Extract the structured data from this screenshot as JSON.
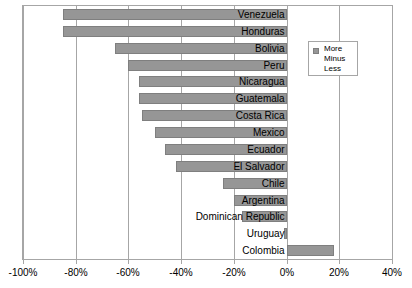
{
  "chart_data": {
    "type": "bar",
    "orientation": "horizontal",
    "title": "",
    "subtitle": "",
    "xlabel": "",
    "ylabel": "",
    "xlim": [
      -100,
      40
    ],
    "xticks": [
      -100,
      -80,
      -60,
      -40,
      -20,
      0,
      20,
      40
    ],
    "xtick_labels": [
      "-100%",
      "-80%",
      "-60%",
      "-40%",
      "-20%",
      "0%",
      "20%",
      "40%"
    ],
    "grid": true,
    "grid_axis": "x",
    "legend_position": "top-right",
    "series": [
      {
        "name": "More Minus Less",
        "color": "#969696",
        "values": [
          -85,
          -85,
          -65,
          -60,
          -56,
          -56,
          -55,
          -50,
          -46,
          -42,
          -24,
          -20,
          -17,
          -1,
          18
        ]
      }
    ],
    "categories": [
      "Venezuela",
      "Honduras",
      "Bolivia",
      "Peru",
      "Nicaragua",
      "Guatemala",
      "Costa Rica",
      "Mexico",
      "Ecuador",
      "El Salvador",
      "Chile",
      "Argentina",
      "Dominican Republic",
      "Uruguay",
      "Colombia"
    ]
  },
  "legend": {
    "lines": [
      "More",
      "Minus",
      "Less"
    ],
    "swatch_color": "#969696"
  },
  "colors": {
    "bar_fill": "#969696",
    "bar_border": "#7f7f7f",
    "gridline": "#a6a6a6",
    "plot_border": "#a6a6a6",
    "text": "#000000",
    "background": "#ffffff"
  }
}
